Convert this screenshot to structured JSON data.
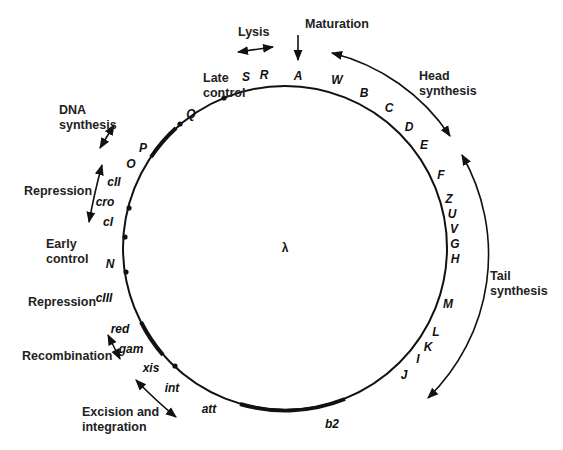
{
  "diagram": {
    "center_label": "λ",
    "genes": [
      {
        "name": "A",
        "x": 298,
        "y": 80
      },
      {
        "name": "R",
        "x": 264,
        "y": 79
      },
      {
        "name": "S",
        "x": 246,
        "y": 81
      },
      {
        "name": "W",
        "x": 337,
        "y": 84
      },
      {
        "name": "B",
        "x": 364,
        "y": 97
      },
      {
        "name": "C",
        "x": 389,
        "y": 112
      },
      {
        "name": "D",
        "x": 409,
        "y": 131
      },
      {
        "name": "E",
        "x": 424,
        "y": 149
      },
      {
        "name": "F",
        "x": 441,
        "y": 179
      },
      {
        "name": "Z",
        "x": 449,
        "y": 203
      },
      {
        "name": "U",
        "x": 452,
        "y": 218
      },
      {
        "name": "V",
        "x": 454,
        "y": 233
      },
      {
        "name": "G",
        "x": 455,
        "y": 248
      },
      {
        "name": "H",
        "x": 455,
        "y": 263
      },
      {
        "name": "M",
        "x": 448,
        "y": 308
      },
      {
        "name": "L",
        "x": 436,
        "y": 336
      },
      {
        "name": "K",
        "x": 428,
        "y": 351
      },
      {
        "name": "I",
        "x": 418,
        "y": 363
      },
      {
        "name": "J",
        "x": 404,
        "y": 379
      },
      {
        "name": "b2",
        "x": 332,
        "y": 428
      },
      {
        "name": "att",
        "x": 209,
        "y": 413
      },
      {
        "name": "int",
        "x": 172,
        "y": 392
      },
      {
        "name": "xis",
        "x": 151,
        "y": 372
      },
      {
        "name": "gam",
        "x": 131,
        "y": 353
      },
      {
        "name": "red",
        "x": 120,
        "y": 333
      },
      {
        "name": "cIII",
        "x": 104,
        "y": 302
      },
      {
        "name": "N",
        "x": 110,
        "y": 268
      },
      {
        "name": "cI",
        "x": 108,
        "y": 226
      },
      {
        "name": "cro",
        "x": 105,
        "y": 206
      },
      {
        "name": "cII",
        "x": 114,
        "y": 186
      },
      {
        "name": "O",
        "x": 131,
        "y": 168
      },
      {
        "name": "P",
        "x": 143,
        "y": 152
      },
      {
        "name": "Q",
        "x": 191,
        "y": 118
      }
    ],
    "functions": [
      {
        "id": "maturation",
        "lines": [
          "Maturation"
        ],
        "x": 305,
        "y": 28
      },
      {
        "id": "lysis",
        "lines": [
          "Lysis"
        ],
        "x": 238,
        "y": 36
      },
      {
        "id": "late-control",
        "lines": [
          "Late",
          "control"
        ],
        "x": 203,
        "y": 82
      },
      {
        "id": "head-synthesis",
        "lines": [
          "Head",
          "synthesis"
        ],
        "x": 419,
        "y": 80
      },
      {
        "id": "tail-synthesis",
        "lines": [
          "Tail",
          "synthesis"
        ],
        "x": 490,
        "y": 280
      },
      {
        "id": "dna-synthesis",
        "lines": [
          "DNA",
          "synthesis"
        ],
        "x": 59,
        "y": 114
      },
      {
        "id": "repression-upper",
        "lines": [
          "Repression"
        ],
        "x": 24,
        "y": 195
      },
      {
        "id": "early-control",
        "lines": [
          "Early",
          "control"
        ],
        "x": 46,
        "y": 248
      },
      {
        "id": "repression-lower",
        "lines": [
          "Repression"
        ],
        "x": 28,
        "y": 306
      },
      {
        "id": "recombination",
        "lines": [
          "Recombination"
        ],
        "x": 22,
        "y": 360
      },
      {
        "id": "excision-integration",
        "lines": [
          "Excision and",
          "integration"
        ],
        "x": 82,
        "y": 416
      }
    ]
  }
}
